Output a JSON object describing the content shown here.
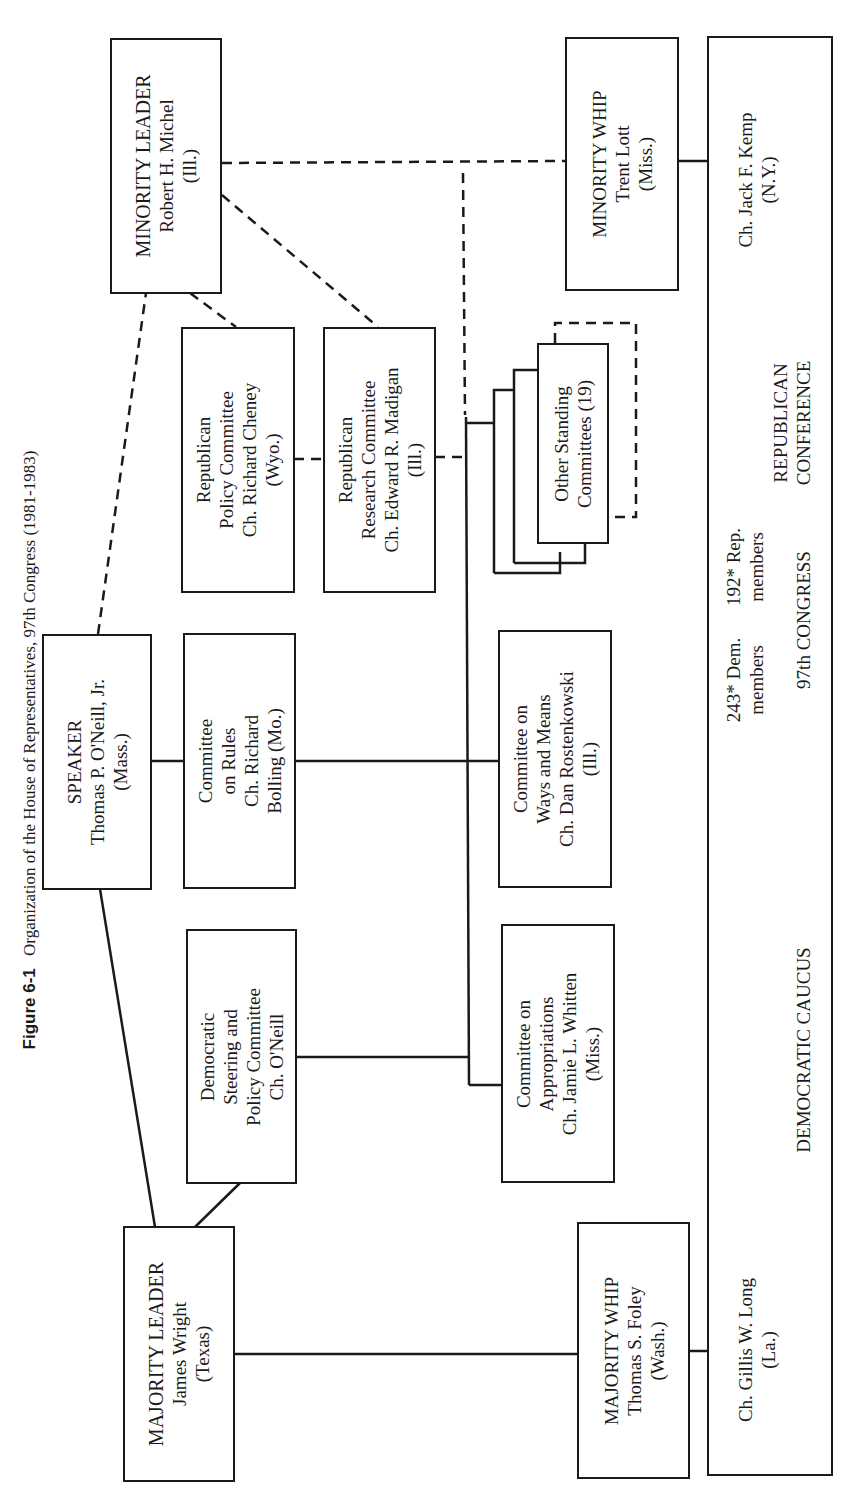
{
  "caption": {
    "figure_label": "Figure 6-1",
    "title": "Organization of the House of Representatives, 97th Congress (1981-1983)"
  },
  "boxes": {
    "minority_leader": {
      "lines": [
        "MINORITY LEADER",
        "Robert H. Michel",
        "(Ill.)"
      ]
    },
    "speaker": {
      "lines": [
        "SPEAKER",
        "Thomas P. O'Neill, Jr.",
        "(Mass.)"
      ]
    },
    "majority_leader": {
      "lines": [
        "MAJORITY LEADER",
        "James Wright",
        "(Texas)"
      ]
    },
    "rep_policy": {
      "lines": [
        "Republican",
        "Policy Committee",
        "Ch. Richard Cheney",
        "(Wyo.)"
      ]
    },
    "rep_research": {
      "lines": [
        "Republican",
        "Research Committee",
        "Ch. Edward R. Madigan",
        "(Ill.)"
      ]
    },
    "rules": {
      "lines": [
        "Committee",
        "on Rules",
        "Ch. Richard",
        "Bolling (Mo.)"
      ]
    },
    "dem_steering": {
      "lines": [
        "Democratic",
        "Steering and",
        "Policy Committee",
        "Ch. O'Neill"
      ]
    },
    "other_standing": {
      "lines": [
        "Other Standing",
        "Committees (19)"
      ]
    },
    "ways_means": {
      "lines": [
        "Committee on",
        "Ways and Means",
        "Ch. Dan Rostenkowski",
        "(Ill.)"
      ]
    },
    "appropriations": {
      "lines": [
        "Committee on",
        "Appropriations",
        "Ch. Jamie L. Whitten",
        "(Miss.)"
      ]
    },
    "minority_whip": {
      "lines": [
        "MINORITY WHIP",
        "Trent Lott",
        "(Miss.)"
      ]
    },
    "majority_whip": {
      "lines": [
        "MAJORITY WHIP",
        "Thomas S. Foley",
        "(Wash.)"
      ]
    }
  },
  "congress_box": {
    "rep_chair": {
      "lines": [
        "Ch. Jack F. Kemp",
        "(N.Y.)"
      ]
    },
    "rep_conference": {
      "lines": [
        "REPUBLICAN",
        "CONFERENCE"
      ]
    },
    "rep_members": {
      "lines": [
        "192* Rep.",
        "members"
      ]
    },
    "dem_members": {
      "lines": [
        "243* Dem.",
        "members"
      ]
    },
    "congress_label": "97th CONGRESS",
    "dem_caucus": "DEMOCRATIC CAUCUS",
    "dem_chair": {
      "lines": [
        "Ch. Gillis W. Long",
        "(La.)"
      ]
    }
  },
  "colors": {
    "ink": "#1a1a1a",
    "paper": "#ffffff"
  }
}
